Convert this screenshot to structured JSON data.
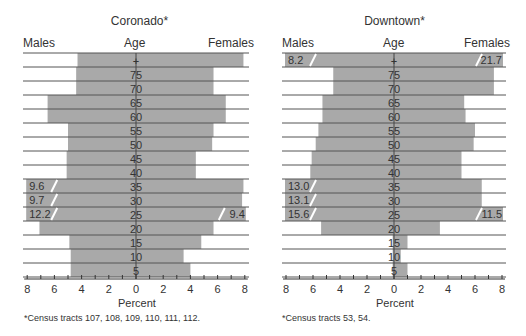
{
  "chart_data": [
    {
      "type": "bar",
      "subtype": "population-pyramid",
      "title": "Coronado*",
      "left_label": "Males",
      "center_label": "Age",
      "right_label": "Females",
      "xlabel": "Percent",
      "xlim": [
        -8,
        8
      ],
      "xticks": [
        "8",
        "6",
        "4",
        "2",
        "0",
        "2",
        "4",
        "6",
        "8"
      ],
      "age_groups": [
        "+",
        "75",
        "70",
        "65",
        "60",
        "55",
        "50",
        "45",
        "40",
        "35",
        "30",
        "25",
        "20",
        "15",
        "10",
        "5"
      ],
      "series": [
        {
          "name": "Males",
          "values": [
            4.3,
            4.4,
            4.4,
            6.5,
            6.5,
            5.0,
            5.0,
            5.1,
            5.1,
            9.6,
            9.7,
            12.2,
            7.1,
            4.9,
            4.8,
            4.8
          ]
        },
        {
          "name": "Females",
          "values": [
            7.9,
            5.7,
            5.7,
            6.6,
            6.6,
            5.7,
            5.6,
            4.4,
            4.4,
            7.9,
            7.8,
            9.4,
            5.7,
            4.8,
            3.5,
            4.0
          ]
        }
      ],
      "broken_bars": [
        {
          "age": "35",
          "side": "Males",
          "label": "9.6"
        },
        {
          "age": "30",
          "side": "Males",
          "label": "9.7"
        },
        {
          "age": "25",
          "side": "Males",
          "label": "12.2"
        },
        {
          "age": "25",
          "side": "Females",
          "label": "9.4"
        }
      ],
      "footnote": "*Census tracts 107, 108, 109, 110, 111, 112."
    },
    {
      "type": "bar",
      "subtype": "population-pyramid",
      "title": "Downtown*",
      "left_label": "Males",
      "center_label": "Age",
      "right_label": "Females",
      "xlabel": "Percent",
      "xlim": [
        -8,
        8
      ],
      "xticks": [
        "8",
        "6",
        "4",
        "2",
        "0",
        "2",
        "4",
        "6",
        "8"
      ],
      "age_groups": [
        "+",
        "75",
        "70",
        "65",
        "60",
        "55",
        "50",
        "45",
        "40",
        "35",
        "30",
        "25",
        "20",
        "15",
        "10",
        "5"
      ],
      "series": [
        {
          "name": "Males",
          "values": [
            8.2,
            4.5,
            4.5,
            5.3,
            5.3,
            5.6,
            5.8,
            6.1,
            6.2,
            13.0,
            13.1,
            15.6,
            5.4,
            0.1,
            0.1,
            0.1
          ]
        },
        {
          "name": "Females",
          "values": [
            21.7,
            7.4,
            7.4,
            5.2,
            5.3,
            6.0,
            5.9,
            5.0,
            5.0,
            6.5,
            6.5,
            11.5,
            3.4,
            1.0,
            0.5,
            1.0
          ]
        }
      ],
      "broken_bars": [
        {
          "age": "+",
          "side": "Males",
          "label": "8.2"
        },
        {
          "age": "+",
          "side": "Females",
          "label": "21.7"
        },
        {
          "age": "35",
          "side": "Males",
          "label": "13.0"
        },
        {
          "age": "30",
          "side": "Males",
          "label": "13.1"
        },
        {
          "age": "25",
          "side": "Males",
          "label": "15.6"
        },
        {
          "age": "25",
          "side": "Females",
          "label": "11.5"
        }
      ],
      "footnote": "*Census tracts 53, 54."
    }
  ],
  "style": {
    "bar_color": "#a9a9a9",
    "line_color": "#555555",
    "break_color": "#ffffff"
  }
}
